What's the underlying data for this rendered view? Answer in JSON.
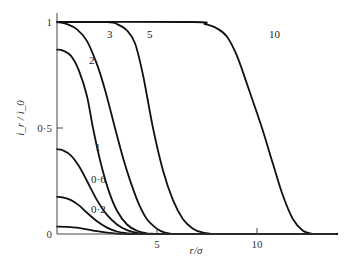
{
  "chart_data": {
    "type": "line",
    "title": "",
    "xlabel": "r/σ",
    "ylabel": "i_r / i_0",
    "xlim": [
      0,
      14
    ],
    "ylim": [
      0,
      1
    ],
    "grid": false,
    "legend": "inline curve labels",
    "x_ticks": [
      {
        "value": 5,
        "label": "5"
      },
      {
        "value": 10,
        "label": "10"
      }
    ],
    "y_ticks": [
      {
        "value": 0,
        "label": "0"
      },
      {
        "value": 0.5,
        "label": "0·5"
      },
      {
        "value": 1,
        "label": "1"
      }
    ],
    "series": [
      {
        "name": "0·2",
        "label_pos": [
          1.7,
          0.1
        ],
        "points": [
          [
            0,
            0.035
          ],
          [
            0.5,
            0.034
          ],
          [
            1,
            0.03
          ],
          [
            1.5,
            0.022
          ],
          [
            2,
            0.013
          ],
          [
            2.5,
            0.006
          ],
          [
            3,
            0.002
          ],
          [
            3.5,
            0
          ]
        ]
      },
      {
        "name": "0·6",
        "label_pos": [
          1.7,
          0.24
        ],
        "points": [
          [
            0,
            0.175
          ],
          [
            0.3,
            0.172
          ],
          [
            0.7,
            0.16
          ],
          [
            1.1,
            0.135
          ],
          [
            1.5,
            0.1
          ],
          [
            2,
            0.06
          ],
          [
            2.5,
            0.03
          ],
          [
            3,
            0.012
          ],
          [
            3.5,
            0.004
          ],
          [
            4,
            0
          ]
        ]
      },
      {
        "name": "1",
        "label_pos": [
          1.9,
          0.39
        ],
        "points": [
          [
            0,
            0.4
          ],
          [
            0.3,
            0.395
          ],
          [
            0.7,
            0.37
          ],
          [
            1.1,
            0.32
          ],
          [
            1.5,
            0.25
          ],
          [
            2,
            0.16
          ],
          [
            2.5,
            0.09
          ],
          [
            3,
            0.045
          ],
          [
            3.5,
            0.018
          ],
          [
            4,
            0.005
          ],
          [
            4.5,
            0
          ]
        ]
      },
      {
        "name": "2",
        "label_pos": [
          1.6,
          0.8
        ],
        "points": [
          [
            0,
            0.87
          ],
          [
            0.3,
            0.865
          ],
          [
            0.7,
            0.84
          ],
          [
            1.1,
            0.77
          ],
          [
            1.5,
            0.65
          ],
          [
            1.8,
            0.5
          ],
          [
            2.2,
            0.33
          ],
          [
            2.6,
            0.2
          ],
          [
            3,
            0.11
          ],
          [
            3.5,
            0.045
          ],
          [
            4,
            0.015
          ],
          [
            4.5,
            0.003
          ],
          [
            5,
            0
          ]
        ]
      },
      {
        "name": "3",
        "label_pos": [
          2.5,
          0.925
        ],
        "points": [
          [
            0,
            1.0
          ],
          [
            0.5,
            0.99
          ],
          [
            1,
            0.965
          ],
          [
            1.5,
            0.91
          ],
          [
            2,
            0.8
          ],
          [
            2.4,
            0.68
          ],
          [
            2.9,
            0.5
          ],
          [
            3.3,
            0.36
          ],
          [
            3.7,
            0.24
          ],
          [
            4.1,
            0.14
          ],
          [
            4.5,
            0.07
          ],
          [
            5,
            0.025
          ],
          [
            5.4,
            0.006
          ],
          [
            5.8,
            0
          ]
        ]
      },
      {
        "name": "5",
        "label_pos": [
          4.5,
          0.925
        ],
        "points": [
          [
            0,
            1.0
          ],
          [
            2.5,
            1.0
          ],
          [
            3,
            0.99
          ],
          [
            3.5,
            0.96
          ],
          [
            3.9,
            0.9
          ],
          [
            4.3,
            0.75
          ],
          [
            4.8,
            0.5
          ],
          [
            5.3,
            0.3
          ],
          [
            5.8,
            0.16
          ],
          [
            6.3,
            0.07
          ],
          [
            6.8,
            0.025
          ],
          [
            7.3,
            0.006
          ],
          [
            7.8,
            0
          ]
        ]
      },
      {
        "name": "10",
        "label_pos": [
          10.6,
          0.925
        ],
        "points": [
          [
            0,
            1.0
          ],
          [
            6.8,
            1.0
          ],
          [
            7.4,
            0.99
          ],
          [
            8,
            0.97
          ],
          [
            8.5,
            0.93
          ],
          [
            9,
            0.84
          ],
          [
            9.6,
            0.68
          ],
          [
            10.25,
            0.5
          ],
          [
            10.8,
            0.33
          ],
          [
            11.3,
            0.18
          ],
          [
            11.8,
            0.07
          ],
          [
            12.3,
            0.015
          ],
          [
            12.8,
            0
          ]
        ]
      }
    ]
  }
}
